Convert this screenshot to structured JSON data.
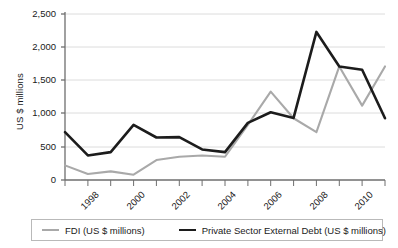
{
  "chart_data": {
    "type": "line",
    "title": "",
    "xlabel": "",
    "ylabel": "US $ millions",
    "x": [
      1998,
      1999,
      2000,
      2001,
      2002,
      2003,
      2004,
      2005,
      2006,
      2007,
      2008,
      2009,
      2010,
      2011,
      2012
    ],
    "xtick_labels": [
      "1998",
      "2000",
      "2002",
      "2004",
      "2006",
      "2008",
      "2010",
      "2012"
    ],
    "xtick_values": [
      1998,
      2000,
      2002,
      2004,
      2006,
      2008,
      2010,
      2012
    ],
    "ytick_labels": [
      "0",
      "500",
      "1,000",
      "1,500",
      "2,000",
      "2,500"
    ],
    "ytick_values": [
      0,
      500,
      1000,
      1500,
      2000,
      2500
    ],
    "ylim": [
      0,
      2500
    ],
    "xlim": [
      1998,
      2012
    ],
    "grid": true,
    "grid_axis": "y",
    "legend_position": "bottom",
    "series": [
      {
        "name": "FDI (US $ millions)",
        "color": "#a9a9a9",
        "values": [
          220,
          90,
          130,
          80,
          300,
          350,
          370,
          350,
          830,
          1330,
          930,
          720,
          1710,
          1120,
          1710
        ]
      },
      {
        "name": "Private Sector External Debt (US $ millions)",
        "color": "#1c1c1c",
        "values": [
          720,
          370,
          420,
          830,
          640,
          645,
          460,
          420,
          860,
          1020,
          935,
          2230,
          1710,
          1660,
          930
        ]
      }
    ]
  },
  "legend": {
    "entries": [
      {
        "label": "FDI (US $ millions)"
      },
      {
        "label": "Private Sector External Debt (US $ millions)"
      }
    ]
  },
  "axes": {
    "y_title": "US $ millions"
  },
  "colors": {
    "fdi": "#a9a9a9",
    "debt": "#1c1c1c",
    "grid": "#dcdcdc",
    "axis": "#6e6e6e",
    "text": "#1a1a1a"
  }
}
